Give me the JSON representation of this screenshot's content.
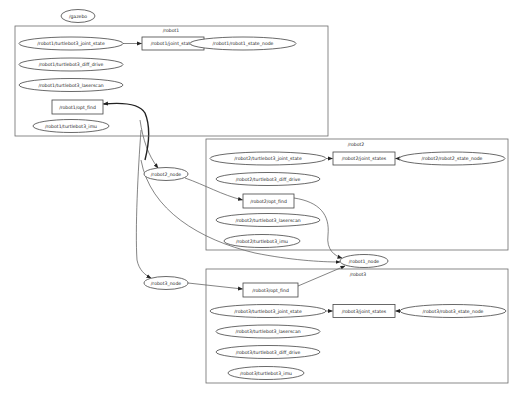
{
  "graph": {
    "root_node": "/gazebo",
    "clusters": {
      "robot1": {
        "label": "/robot1",
        "nodes": {
          "joint_state": "/robot1/turtlebot3_joint_state",
          "joint_states": "/robot1/joint_states",
          "state_node": "/robot1/robot1_state_node",
          "diff_drive": "/robot1/turtlebot3_diff_drive",
          "laserscan": "/robot1/turtlebot3_laserscan",
          "opt_find": "/robot1/opt_find",
          "imu": "/robot1/turtlebot3_imu"
        }
      },
      "robot2": {
        "label": "/robot2",
        "nodes": {
          "joint_state": "/robot2/turtlebot3_joint_state",
          "joint_states": "/robot2/joint_states",
          "state_node": "/robot2/robot2_state_node",
          "diff_drive": "/robot2/turtlebot3_diff_drive",
          "opt_find": "/robot2/opt_find",
          "laserscan": "/robot2/turtlebot3_laserscan",
          "imu": "/robot2/turtlebot3_imu"
        }
      },
      "robot3": {
        "label": "/robot3",
        "nodes": {
          "opt_find": "/robot3/opt_find",
          "joint_state": "/robot3/turtlebot3_joint_state",
          "joint_states": "/robot3/joint_states",
          "state_node": "/robot3/robot3_state_node",
          "laserscan": "/robot3/turtlebot3_laserscan",
          "diff_drive": "/robot3/turtlebot3_diff_drive",
          "imu": "/robot3/turtlebot3_imu"
        }
      }
    },
    "free_nodes": {
      "robot2_node": "/robot2_node",
      "robot1_node": "/robot1_node",
      "robot3_node": "/robot3_node"
    },
    "edges": [
      {
        "from": "/robot1/turtlebot3_joint_state",
        "to": "/robot1/joint_states"
      },
      {
        "from": "/robot1/joint_states",
        "to": "/robot1/robot1_state_node"
      },
      {
        "from": "/robot2/turtlebot3_joint_state",
        "to": "/robot2/joint_states"
      },
      {
        "from": "/robot2/robot2_state_node",
        "to": "/robot2/joint_states"
      },
      {
        "from": "/robot3/turtlebot3_joint_state",
        "to": "/robot3/joint_states"
      },
      {
        "from": "/robot3/robot3_state_node",
        "to": "/robot3/joint_states"
      },
      {
        "from": "/robot1_node",
        "to": "/robot1/opt_find"
      },
      {
        "from": "/robot1/opt_find",
        "to": "/robot2_node"
      },
      {
        "from": "/robot1/opt_find",
        "to": "/robot3_node"
      },
      {
        "from": "/robot2_node",
        "to": "/robot2/opt_find"
      },
      {
        "from": "/robot2/opt_find",
        "to": "/robot1_node"
      },
      {
        "from": "/robot3_node",
        "to": "/robot3/opt_find"
      },
      {
        "from": "/robot3/opt_find",
        "to": "/robot1_node"
      },
      {
        "from": "/robot2_node",
        "to": "/robot1_node"
      }
    ]
  }
}
